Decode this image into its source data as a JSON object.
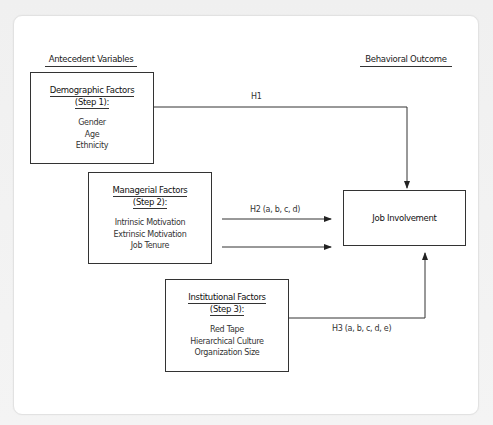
{
  "diagram": {
    "headings": {
      "antecedent": "Antecedent Variables",
      "outcome": "Behavioral Outcome"
    },
    "boxes": [
      {
        "title": "Demographic Factors",
        "step": "(Step 1):",
        "items": [
          "Gender",
          "Age",
          "Ethnicity"
        ]
      },
      {
        "title": "Managerial Factors",
        "step": "(Step 2):",
        "items": [
          "Intrinsic Motivation",
          "Extrinsic Motivation",
          "Job Tenure"
        ]
      },
      {
        "title": "Institutional Factors",
        "step": "(Step 3):",
        "items": [
          "Red Tape",
          "Hierarchical Culture",
          "Organization Size"
        ]
      }
    ],
    "outcome_box": {
      "label": "Job Involvement"
    },
    "hypotheses": {
      "h1": "H1",
      "h2": "H2 (a, b, c, d)",
      "h3": "H3 (a, b, c, d, e)"
    },
    "colors": {
      "line": "#333333",
      "card_background": "#ffffff",
      "page_background": "#f2f2f2"
    }
  }
}
